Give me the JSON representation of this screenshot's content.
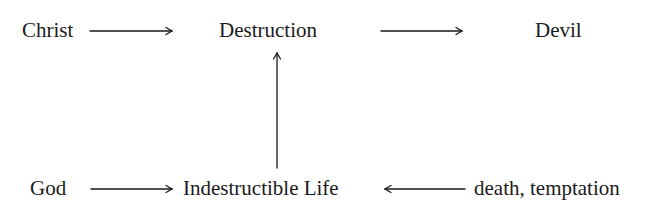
{
  "diagram": {
    "nodes": {
      "christ": "Christ",
      "destruction": "Destruction",
      "devil": "Devil",
      "god": "God",
      "indestructible_life": "Indestructible Life",
      "death_temptation": "death, temptation"
    },
    "edges": [
      {
        "from": "Christ",
        "to": "Destruction"
      },
      {
        "from": "Destruction",
        "to": "Devil"
      },
      {
        "from": "Indestructible Life",
        "to": "Destruction"
      },
      {
        "from": "God",
        "to": "Indestructible Life"
      },
      {
        "from": "death, temptation",
        "to": "Indestructible Life"
      }
    ],
    "colors": {
      "text": "#1a1a1a",
      "arrow": "#1a1a1a",
      "background": "#ffffff"
    }
  }
}
